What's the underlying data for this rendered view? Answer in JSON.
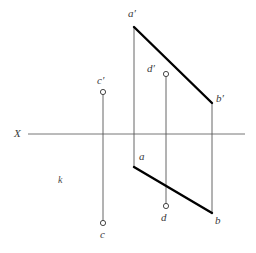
{
  "figure": {
    "width": 256,
    "height": 253,
    "background_color": "#ffffff",
    "thick_line_color": "#000000",
    "thin_line_color": "#555555",
    "axis_line_color": "#777777",
    "text_color": "#3a3a3a"
  },
  "axis": {
    "name": "X",
    "label": "X",
    "y": 134,
    "x_start": 28,
    "x_end": 245,
    "label_x": 14,
    "label_y": 128
  },
  "plane": {
    "label": "k",
    "label_x": 58,
    "label_y": 175
  },
  "points": [
    {
      "id": "a-prime",
      "label": "a′",
      "x": 134,
      "y": 27,
      "label_x": 128,
      "label_y": 8,
      "marker": "none",
      "view": "frontal"
    },
    {
      "id": "b-prime",
      "label": "b′",
      "x": 212,
      "y": 103,
      "label_x": 216,
      "label_y": 93,
      "marker": "none",
      "view": "frontal"
    },
    {
      "id": "a",
      "label": "a",
      "x": 134,
      "y": 167,
      "label_x": 139,
      "label_y": 151,
      "marker": "none",
      "view": "horizontal"
    },
    {
      "id": "b",
      "label": "b",
      "x": 212,
      "y": 213,
      "label_x": 215,
      "label_y": 215,
      "marker": "none",
      "view": "horizontal"
    },
    {
      "id": "c-prime",
      "label": "c′",
      "x": 103,
      "y": 92,
      "label_x": 97,
      "label_y": 75,
      "marker": "circle",
      "view": "frontal"
    },
    {
      "id": "c",
      "label": "c",
      "x": 103,
      "y": 223,
      "label_x": 100,
      "label_y": 229,
      "marker": "circle",
      "view": "horizontal"
    },
    {
      "id": "d-prime",
      "label": "d′",
      "x": 166,
      "y": 74,
      "label_x": 147,
      "label_y": 63,
      "marker": "circle",
      "view": "frontal"
    },
    {
      "id": "d",
      "label": "d",
      "x": 166,
      "y": 206,
      "label_x": 161,
      "label_y": 212,
      "marker": "circle",
      "view": "horizontal"
    }
  ],
  "segments": [
    {
      "id": "ab-frontal",
      "name": "a-prime-b-prime-segment",
      "x1": 134,
      "y1": 27,
      "x2": 212,
      "y2": 103,
      "weight": "thick"
    },
    {
      "id": "ab-horizontal",
      "name": "a-b-segment",
      "x1": 134,
      "y1": 167,
      "x2": 212,
      "y2": 213,
      "weight": "thick"
    },
    {
      "id": "a-projector",
      "name": "a-projection-line",
      "x1": 134,
      "y1": 27,
      "x2": 134,
      "y2": 167,
      "weight": "thin"
    },
    {
      "id": "b-projector",
      "name": "b-projection-line",
      "x1": 212,
      "y1": 103,
      "x2": 212,
      "y2": 213,
      "weight": "thin"
    },
    {
      "id": "c-projector",
      "name": "c-projection-line",
      "x1": 103,
      "y1": 92,
      "x2": 103,
      "y2": 223,
      "weight": "thin"
    },
    {
      "id": "d-projector",
      "name": "d-projection-line",
      "x1": 166,
      "y1": 74,
      "x2": 166,
      "y2": 206,
      "weight": "thin"
    }
  ]
}
